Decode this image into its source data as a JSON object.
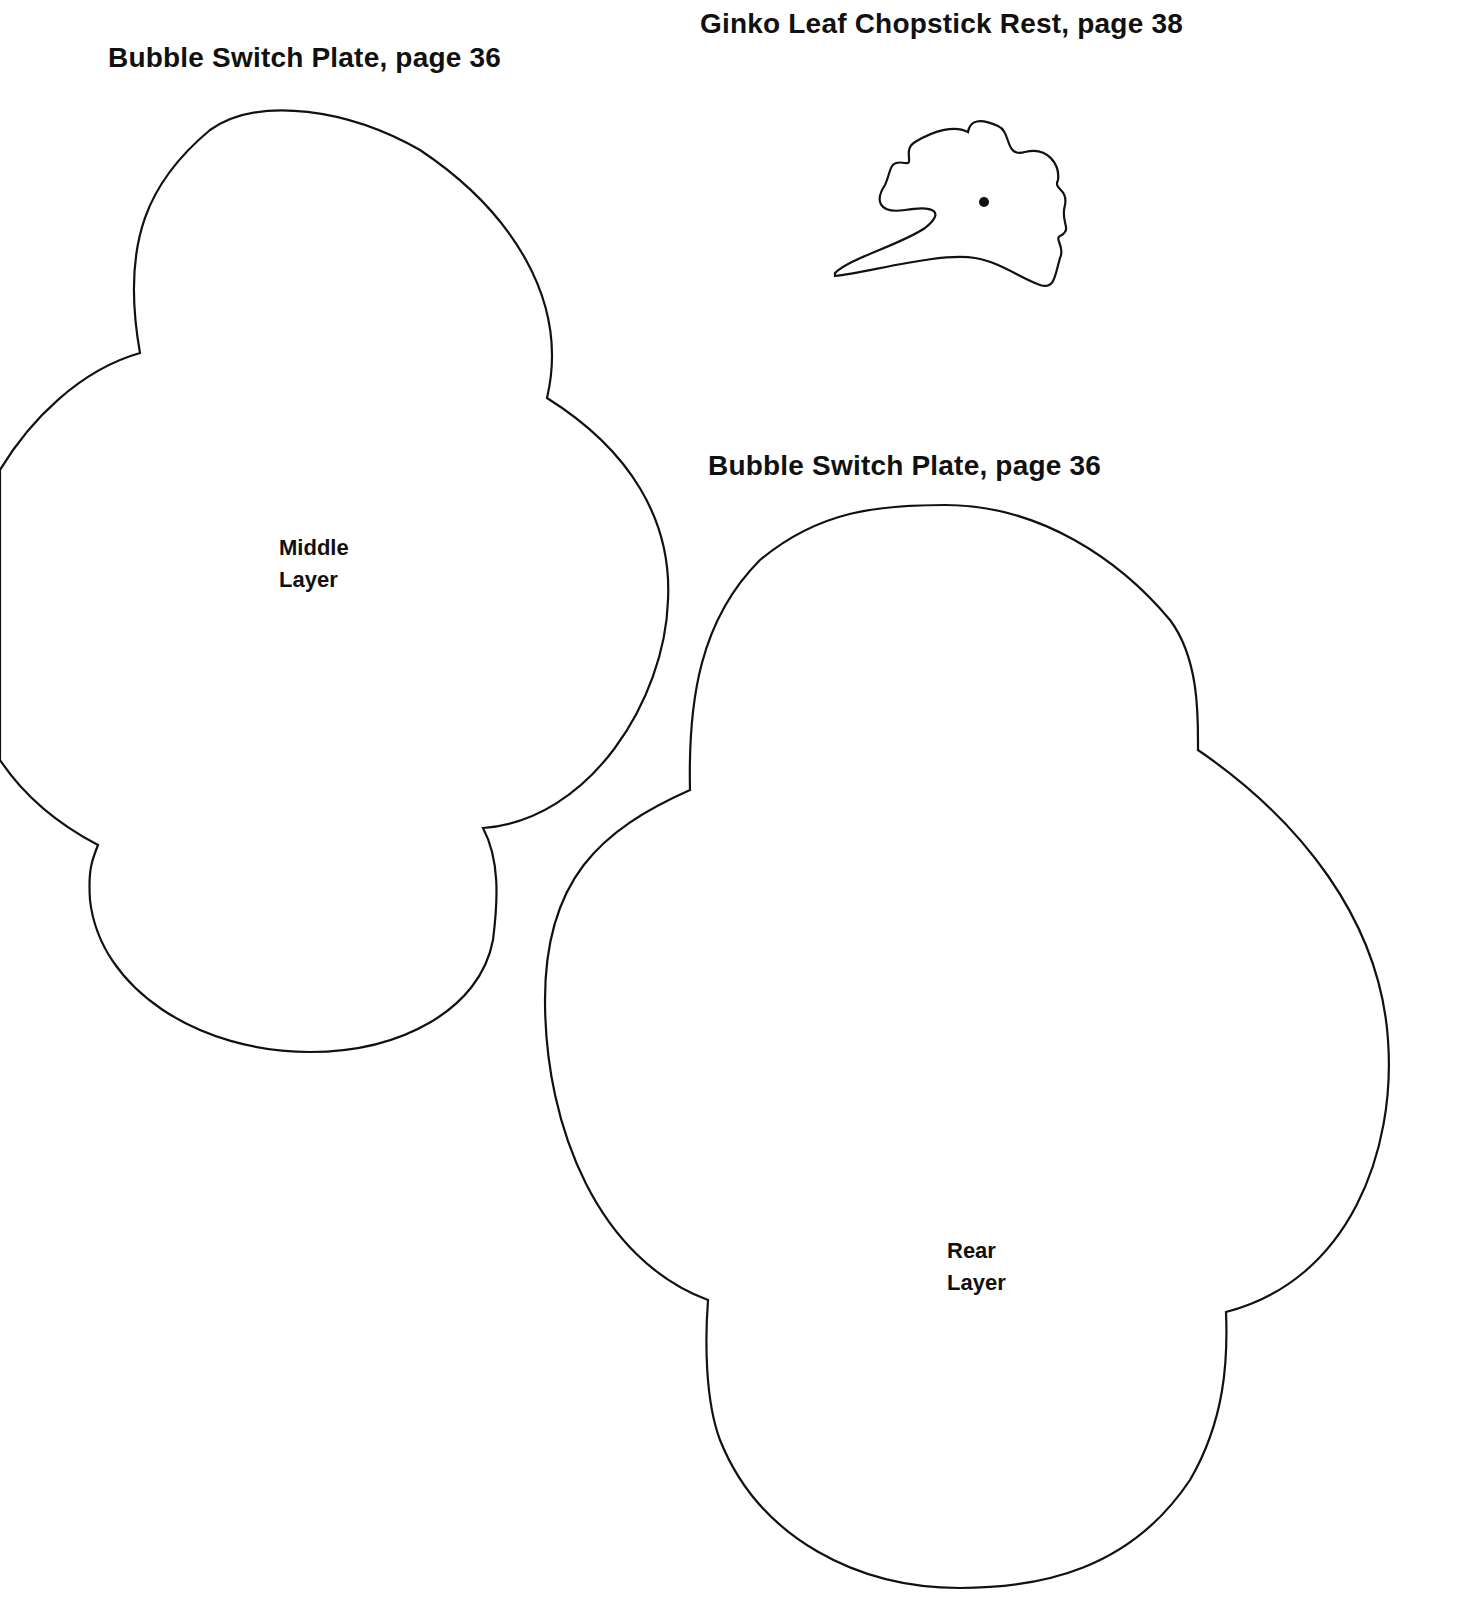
{
  "page": {
    "background": "#ffffff",
    "ink_color": "#111111"
  },
  "templates": [
    {
      "id": "middle-layer",
      "title": "Bubble Switch Plate, page 36",
      "label_lines": [
        "Middle",
        "Layer"
      ]
    },
    {
      "id": "ginko-leaf",
      "title": "Ginko Leaf Chopstick Rest, page 38"
    },
    {
      "id": "rear-layer",
      "title": "Bubble Switch Plate, page 36",
      "label_lines": [
        "Rear",
        "Layer"
      ]
    }
  ]
}
